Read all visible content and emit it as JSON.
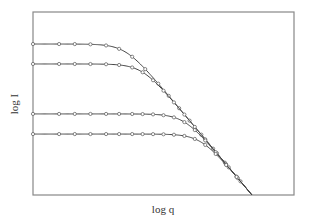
{
  "chart_data": {
    "type": "line",
    "title": "",
    "xlabel": "log q",
    "ylabel": "log I",
    "xlim": [
      0,
      10
    ],
    "ylim": [
      0,
      10
    ],
    "grid": false,
    "legend": "none",
    "tick_labels": false,
    "asymptote": {
      "slope": -1.7,
      "x_intercept": 8.39
    },
    "series": [
      {
        "name": "curve-1",
        "plateau": 8.25,
        "markers_x": [
          0.0,
          1.0,
          1.6,
          2.2,
          2.8,
          3.3,
          3.8,
          4.3,
          4.8,
          5.2,
          5.6,
          6.0
        ]
      },
      {
        "name": "curve-2",
        "plateau": 7.16,
        "markers_x": [
          0.0,
          1.0,
          1.6,
          2.2,
          2.8,
          3.3,
          3.8,
          4.2,
          4.6,
          5.0,
          5.4,
          5.8,
          6.2,
          6.6
        ]
      },
      {
        "name": "curve-3",
        "plateau": 4.43,
        "markers_x": [
          0.0,
          1.0,
          1.6,
          2.2,
          2.8,
          3.3,
          3.8,
          4.2,
          4.6,
          5.0,
          5.4,
          5.8,
          6.2,
          6.6,
          7.0,
          7.4
        ]
      },
      {
        "name": "curve-4",
        "plateau": 3.33,
        "markers_x": [
          0.0,
          1.0,
          1.6,
          2.2,
          2.8,
          3.3,
          3.8,
          4.2,
          4.6,
          5.0,
          5.4,
          5.8,
          6.2,
          6.6,
          7.0,
          7.4,
          7.8
        ]
      }
    ]
  }
}
